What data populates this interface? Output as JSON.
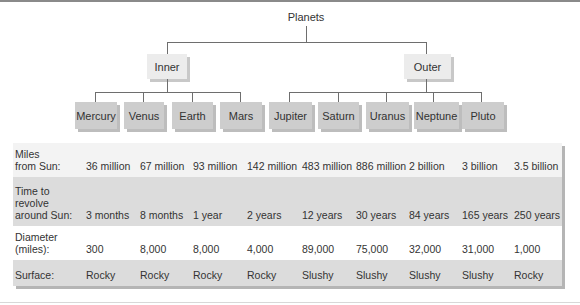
{
  "diagram": {
    "root": "Planets",
    "groups": [
      {
        "label": "Inner",
        "children": [
          "Mercury",
          "Venus",
          "Earth",
          "Mars"
        ]
      },
      {
        "label": "Outer",
        "children": [
          "Jupiter",
          "Saturn",
          "Uranus",
          "Neptune",
          "Pluto"
        ]
      }
    ],
    "planets": [
      "Mercury",
      "Venus",
      "Earth",
      "Mars",
      "Jupiter",
      "Saturn",
      "Uranus",
      "Neptune",
      "Pluto"
    ]
  },
  "table": {
    "rows": [
      {
        "label": "Miles\nfrom Sun:",
        "values": [
          "36 million",
          "67 million",
          "93 million",
          "142 million",
          "483 million",
          "886 million",
          "2 billion",
          "3 billion",
          "3.5 billion"
        ]
      },
      {
        "label": "Time to\nrevolve\naround Sun:",
        "values": [
          "3 months",
          "8 months",
          "1 year",
          "2 years",
          "12 years",
          "30 years",
          "84 years",
          "165 years",
          "250 years"
        ]
      },
      {
        "label": "Diameter\n(miles):",
        "values": [
          "300",
          "8,000",
          "8,000",
          "4,000",
          "89,000",
          "75,000",
          "32,000",
          "31,000",
          "1,000"
        ]
      },
      {
        "label": "Surface:",
        "values": [
          "Rocky",
          "Rocky",
          "Rocky",
          "Rocky",
          "Slushy",
          "Slushy",
          "Slushy",
          "Slushy",
          "Rocky"
        ]
      }
    ]
  }
}
